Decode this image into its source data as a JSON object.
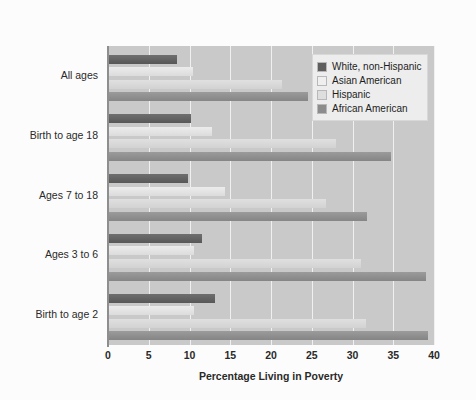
{
  "chart_data": {
    "type": "bar",
    "orientation": "horizontal",
    "title": "",
    "xlabel": "Percentage Living in Poverty",
    "ylabel": "",
    "xlim": [
      0,
      40
    ],
    "xticks": [
      0,
      5,
      10,
      15,
      20,
      25,
      30,
      35,
      40
    ],
    "grid": true,
    "legend_position": "top-right",
    "categories": [
      "All ages",
      "Birth to age 18",
      "Ages 7 to 18",
      "Ages 3 to 6",
      "Birth to age 2"
    ],
    "series": [
      {
        "name": "White, non-Hispanic",
        "color": "#5e5e5e",
        "values": [
          8.5,
          10.2,
          9.8,
          11.5,
          13.1
        ]
      },
      {
        "name": "Asian American",
        "color": "#efefef",
        "values": [
          10.4,
          12.8,
          14.3,
          10.5,
          10.5
        ]
      },
      {
        "name": "Hispanic",
        "color": "#dedede",
        "values": [
          21.4,
          28.0,
          26.7,
          31.0,
          31.6
        ]
      },
      {
        "name": "African American",
        "color": "#8c8c8c",
        "values": [
          24.6,
          34.7,
          31.8,
          39.0,
          39.3
        ]
      }
    ]
  },
  "axis": {
    "x_title": "Percentage Living in Poverty",
    "tick_labels": [
      "0",
      "5",
      "10",
      "15",
      "20",
      "25",
      "30",
      "35",
      "40"
    ]
  },
  "legend": {
    "entries": [
      {
        "label": "White, non-Hispanic"
      },
      {
        "label": "Asian American"
      },
      {
        "label": "Hispanic"
      },
      {
        "label": "African American"
      }
    ]
  },
  "categories": [
    {
      "label": "All ages"
    },
    {
      "label": "Birth to age 18"
    },
    {
      "label": "Ages 7 to 18"
    },
    {
      "label": "Ages 3 to 6"
    },
    {
      "label": "Birth to age 2"
    }
  ],
  "colors": {
    "plot_background": "#c9c9c9",
    "gridline": "#f0f0f0",
    "axis": "#8e8e8e",
    "page_background": "#fcfcfc",
    "text": "#2a2a2a"
  }
}
